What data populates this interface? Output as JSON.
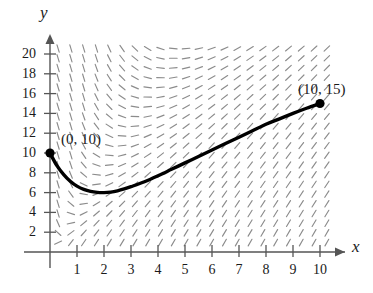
{
  "figure": {
    "axis_labels": {
      "x": "x",
      "y": "y"
    },
    "x_ticks": [
      "1",
      "2",
      "3",
      "4",
      "5",
      "6",
      "7",
      "8",
      "9",
      "10"
    ],
    "y_ticks": [
      "2",
      "4",
      "6",
      "8",
      "10",
      "12",
      "14",
      "16",
      "18",
      "20"
    ],
    "annotations": [
      {
        "id": "start-point",
        "label": "(0, 10)"
      },
      {
        "id": "end-point",
        "label": "(10, 15)"
      }
    ],
    "colors": {
      "curve": "#000000",
      "slope_field": "#8c8c8c",
      "axis": "#555555",
      "text": "#1a1a1a",
      "background": "#ffffff"
    }
  },
  "chart_data": {
    "type": "line",
    "title": "",
    "xlabel": "x",
    "ylabel": "y",
    "xlim": [
      0,
      10.6
    ],
    "ylim": [
      0,
      21
    ],
    "grid": false,
    "legend": null,
    "xticks": [
      1,
      2,
      3,
      4,
      5,
      6,
      7,
      8,
      9,
      10
    ],
    "yticks": [
      2,
      4,
      6,
      8,
      10,
      12,
      14,
      16,
      18,
      20
    ],
    "series": [
      {
        "name": "solution curve",
        "x": [
          0.0,
          0.25,
          0.5,
          0.75,
          1.0,
          1.25,
          1.5,
          1.75,
          2.0,
          2.25,
          2.5,
          2.75,
          3.0,
          3.5,
          4.0,
          4.5,
          5.0,
          5.5,
          6.0,
          6.5,
          7.0,
          7.5,
          8.0,
          8.5,
          9.0,
          9.5,
          10.0
        ],
        "y": [
          10.0,
          8.75,
          7.85,
          7.15,
          6.65,
          6.32,
          6.12,
          6.02,
          6.0,
          6.05,
          6.18,
          6.37,
          6.6,
          7.1,
          7.7,
          8.35,
          9.0,
          9.65,
          10.3,
          10.95,
          11.6,
          12.25,
          12.9,
          13.45,
          14.0,
          14.52,
          15.0
        ]
      }
    ],
    "markers": [
      {
        "x": 0,
        "y": 10,
        "label": "(0, 10)"
      },
      {
        "x": 10,
        "y": 15,
        "label": "(10, 15)"
      }
    ],
    "slope_field": {
      "description": "dashed gray line segments indicating direction field slopes",
      "color": "#8c8c8c"
    }
  }
}
